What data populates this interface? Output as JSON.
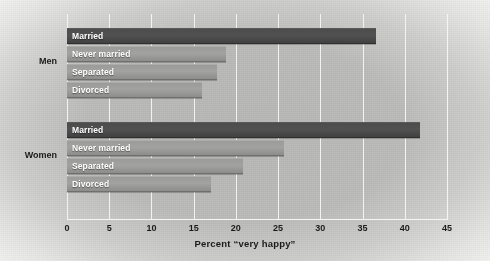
{
  "chart_data": {
    "type": "bar",
    "orientation": "horizontal",
    "title": "",
    "xlabel": "Percent “very happy”",
    "ylabel": "",
    "xlim": [
      0,
      45
    ],
    "xticks": [
      "0",
      "5",
      "10",
      "15",
      "20",
      "25",
      "30",
      "35",
      "40",
      "45"
    ],
    "xtick_values": [
      0,
      5,
      10,
      15,
      20,
      25,
      30,
      35,
      40,
      45
    ],
    "grid": true,
    "legend": "none",
    "categories": [
      "Married",
      "Never married",
      "Separated",
      "Divorced"
    ],
    "groups": [
      {
        "name": "Men",
        "bars": [
          {
            "label": "Married",
            "value": 36.6,
            "style": "dark"
          },
          {
            "label": "Never married",
            "value": 18.8,
            "style": "light"
          },
          {
            "label": "Separated",
            "value": 17.8,
            "style": "light"
          },
          {
            "label": "Divorced",
            "value": 16.0,
            "style": "light"
          }
        ]
      },
      {
        "name": "Women",
        "bars": [
          {
            "label": "Married",
            "value": 41.8,
            "style": "dark"
          },
          {
            "label": "Never married",
            "value": 25.7,
            "style": "light"
          },
          {
            "label": "Separated",
            "value": 20.8,
            "style": "light"
          },
          {
            "label": "Divorced",
            "value": 17.0,
            "style": "light"
          }
        ]
      }
    ],
    "colors": {
      "bar_dark": "#4c4c4c",
      "bar_light": "#9b9b99",
      "gridline": "#f2f2f0",
      "background": "#bdbdbb",
      "text": "#1b1b1b",
      "bar_label_text": "#ffffff"
    }
  }
}
